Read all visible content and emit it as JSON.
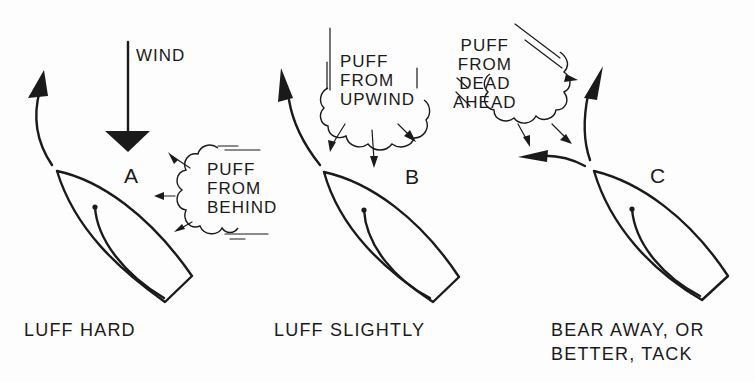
{
  "diagram": {
    "type": "sailing-tactics-illustration",
    "colors": {
      "ink": "#1a1a1a",
      "background": "#fdfdfd"
    },
    "wind": {
      "label": "WIND",
      "direction": "down"
    },
    "panels": [
      {
        "id": "A",
        "letter": "A",
        "puff_label": "PUFF\nFROM\nBEHIND",
        "caption": "LUFF HARD",
        "course_change": "sharp turn to windward (left)"
      },
      {
        "id": "B",
        "letter": "B",
        "puff_label": "PUFF\nFROM\nUPWIND",
        "caption": "LUFF SLIGHTLY",
        "course_change": "slight turn to windward (left)"
      },
      {
        "id": "C",
        "letter": "C",
        "puff_label": "PUFF\nFROM\nDEAD\nAHEAD",
        "caption": "BEAR AWAY, OR\nBETTER, TACK",
        "course_change": "bear away (up arrow) or tack (left arrow)"
      }
    ]
  }
}
